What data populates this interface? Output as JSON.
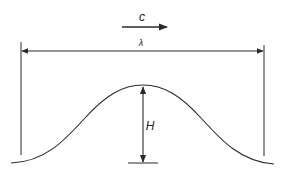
{
  "diagram": {
    "labels": {
      "celerity": "c",
      "wavelength": "λ",
      "height": "H"
    },
    "colors": {
      "stroke": "#2a2a2a",
      "background": "#ffffff"
    },
    "elements": [
      {
        "id": "celerity-arrow",
        "meaning": "direction of wave propagation"
      },
      {
        "id": "wavelength-dimension",
        "meaning": "crest-to-crest distance"
      },
      {
        "id": "wave-profile",
        "meaning": "single wave crest"
      },
      {
        "id": "height-dimension",
        "meaning": "trough-to-crest height"
      }
    ]
  }
}
